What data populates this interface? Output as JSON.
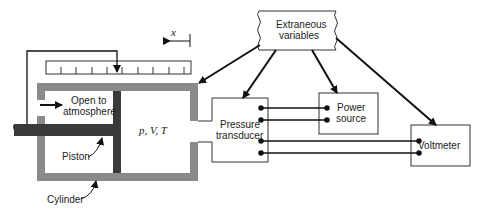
{
  "diagram": {
    "labels": {
      "extraneous_1": "Extraneous",
      "extraneous_2": "variables",
      "open_1": "Open to",
      "open_2": "atmosphere",
      "state": "p, V, T",
      "piston": "Piston",
      "cylinder": "Cylinder",
      "transducer_1": "Pressure",
      "transducer_2": "transducer",
      "power_1": "Power",
      "power_2": "source",
      "voltmeter": "Voltmeter",
      "x_axis": "x"
    },
    "colors": {
      "cylinder": "#8a8a8a",
      "piston": "#3a3a3a",
      "line": "#111111"
    }
  }
}
